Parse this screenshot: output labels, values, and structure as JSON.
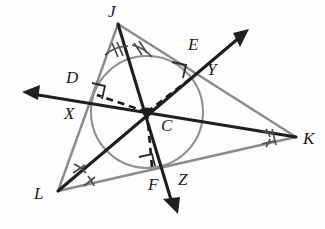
{
  "figure": {
    "canvas": {
      "width": 325,
      "height": 229
    },
    "colors": {
      "triangle_stroke": "#8a8a8a",
      "circle_stroke": "#8a8a8a",
      "bisector_stroke": "#1f1f1f",
      "dashed_radius_stroke": "#1a1a1a",
      "tick_stroke": "#4a4a4a",
      "right_angle_stroke": "#2a2a2a",
      "label_color": "#1a1a1a",
      "background": "#fdfdfd"
    },
    "vertices": [
      {
        "name": "J",
        "x": 118,
        "y": 24,
        "label_x": 108,
        "label_y": 3
      },
      {
        "name": "K",
        "x": 296,
        "y": 137,
        "label_x": 303,
        "label_y": 130
      },
      {
        "name": "L",
        "x": 58,
        "y": 191,
        "label_x": 36,
        "label_y": 186
      }
    ],
    "incenter": {
      "name": "C",
      "x": 147,
      "y": 112,
      "label_x": 160,
      "label_y": 118
    },
    "incircle": {
      "cx": 147,
      "cy": 112,
      "r": 56
    },
    "tangent_points": [
      {
        "name": "D",
        "x": 96,
        "y": 95,
        "label_x": 68,
        "label_y": 70,
        "side": "JL"
      },
      {
        "name": "E",
        "x": 190,
        "y": 79,
        "label_x": 190,
        "label_y": 37,
        "side": "JK"
      },
      {
        "name": "F",
        "x": 152,
        "y": 167,
        "label_x": 152,
        "label_y": 178,
        "side": "LK"
      }
    ],
    "ray_endpoints": [
      {
        "name": "X",
        "x": 24,
        "y": 92,
        "label_x": 65,
        "label_y": 106,
        "from": "K",
        "through": "C"
      },
      {
        "name": "Y",
        "x": 247,
        "y": 30,
        "label_x": 209,
        "label_y": 62,
        "from": "L",
        "through": "C"
      },
      {
        "name": "Z",
        "x": 178,
        "y": 212,
        "label_x": 180,
        "label_y": 172,
        "from": "J",
        "through": "C"
      }
    ],
    "bisector_rays": [
      {
        "name": "bisector-from-J-to-Z",
        "start_vertex": "J",
        "end_point": "Z"
      },
      {
        "name": "bisector-from-K-to-X",
        "start_vertex": "K",
        "end_point": "X"
      },
      {
        "name": "bisector-from-L-to-Y",
        "start_vertex": "L",
        "end_point": "Y"
      }
    ],
    "angle_tick_counts": {
      "J": 2,
      "K": 3,
      "L": 1
    },
    "right_angle_marks": [
      "at-D",
      "at-E",
      "at-F"
    ],
    "dashed_radii": [
      "C-to-D",
      "C-to-E",
      "C-to-F"
    ],
    "labels": [
      {
        "id": "J",
        "text": "J"
      },
      {
        "id": "K",
        "text": "K"
      },
      {
        "id": "L",
        "text": "L"
      },
      {
        "id": "C",
        "text": "C"
      },
      {
        "id": "D",
        "text": "D"
      },
      {
        "id": "E",
        "text": "E"
      },
      {
        "id": "F",
        "text": "F"
      },
      {
        "id": "X",
        "text": "X"
      },
      {
        "id": "Y",
        "text": "Y"
      },
      {
        "id": "Z",
        "text": "Z"
      }
    ]
  }
}
